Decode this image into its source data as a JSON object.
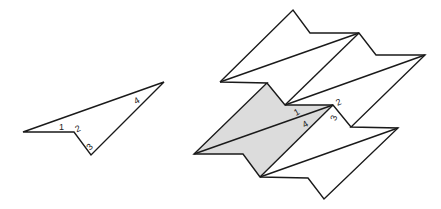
{
  "figure": {
    "left_shape": {
      "description": "Single folded quadrilateral piece with numbered corners",
      "labels": [
        {
          "text": "1",
          "x": 61,
          "y": 130,
          "rotate": 0
        },
        {
          "text": "2",
          "x": 76,
          "y": 131,
          "rotate": -25
        },
        {
          "text": "3",
          "x": 86,
          "y": 148,
          "rotate": -45
        },
        {
          "text": "4",
          "x": 135,
          "y": 102,
          "rotate": -30
        }
      ],
      "stroke_color": "#1a1a1a"
    },
    "right_shape": {
      "description": "Tessellated assembly of pieces with one shaded piece",
      "shaded_color": "#dcdcdc",
      "labels": [
        {
          "text": "1",
          "x": 294,
          "y": 115,
          "rotate": -30
        },
        {
          "text": "4",
          "x": 302,
          "y": 127,
          "rotate": -30
        },
        {
          "text": "2",
          "x": 336,
          "y": 105,
          "rotate": -25
        },
        {
          "text": "3",
          "x": 331,
          "y": 120,
          "rotate": -70
        }
      ]
    }
  }
}
